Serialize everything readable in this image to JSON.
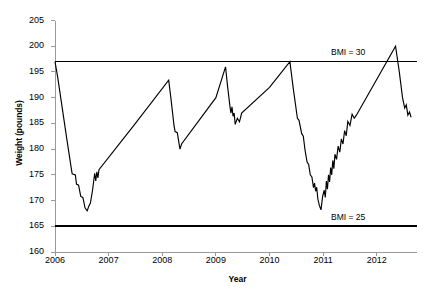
{
  "chart_data": {
    "type": "line",
    "title": "",
    "xlabel": "Year",
    "ylabel": "Weight (pounds)",
    "xlim": [
      2006,
      2012.75
    ],
    "ylim": [
      160,
      205
    ],
    "xticks": [
      "2006",
      "2007",
      "2008",
      "2009",
      "2010",
      "2011",
      "2012"
    ],
    "xtick_values": [
      2006,
      2007,
      2008,
      2009,
      2010,
      2011,
      2012
    ],
    "yticks": [
      "160",
      "165",
      "170",
      "175",
      "180",
      "185",
      "190",
      "195",
      "200",
      "205"
    ],
    "ytick_values": [
      160,
      165,
      170,
      175,
      180,
      185,
      190,
      195,
      200,
      205
    ],
    "grid": false,
    "legend": false,
    "line_color": "#000000",
    "reference_lines": [
      {
        "label": "BMI = 30",
        "value": 197,
        "color": "#000000"
      },
      {
        "label": "BMI = 25",
        "value": 165,
        "color": "#000000"
      }
    ],
    "series": [
      {
        "name": "Weight",
        "points": [
          [
            2006.0,
            197.0
          ],
          [
            2006.05,
            194.0
          ],
          [
            2006.22,
            182.0
          ],
          [
            2006.3,
            176.5
          ],
          [
            2006.32,
            175.2
          ],
          [
            2006.38,
            175.0
          ],
          [
            2006.4,
            173.2
          ],
          [
            2006.44,
            173.0
          ],
          [
            2006.48,
            170.8
          ],
          [
            2006.52,
            170.6
          ],
          [
            2006.56,
            168.6
          ],
          [
            2006.6,
            168.0
          ],
          [
            2006.63,
            168.9
          ],
          [
            2006.66,
            169.5
          ],
          [
            2006.7,
            172.0
          ],
          [
            2006.74,
            175.3
          ],
          [
            2006.76,
            173.8
          ],
          [
            2006.78,
            175.6
          ],
          [
            2006.8,
            174.4
          ],
          [
            2006.82,
            176.0
          ],
          [
            2007.5,
            185.0
          ],
          [
            2008.12,
            193.4
          ],
          [
            2008.16,
            190.0
          ],
          [
            2008.22,
            184.5
          ],
          [
            2008.24,
            183.4
          ],
          [
            2008.28,
            183.2
          ],
          [
            2008.33,
            180.0
          ],
          [
            2008.36,
            181.0
          ],
          [
            2009.0,
            190.0
          ],
          [
            2009.18,
            196.0
          ],
          [
            2009.22,
            192.0
          ],
          [
            2009.26,
            188.5
          ],
          [
            2009.28,
            187.0
          ],
          [
            2009.3,
            188.2
          ],
          [
            2009.32,
            186.4
          ],
          [
            2009.34,
            187.0
          ],
          [
            2009.36,
            184.8
          ],
          [
            2009.4,
            186.0
          ],
          [
            2009.44,
            185.3
          ],
          [
            2009.48,
            187.0
          ],
          [
            2010.0,
            192.0
          ],
          [
            2010.38,
            197.0
          ],
          [
            2010.44,
            192.0
          ],
          [
            2010.52,
            186.0
          ],
          [
            2010.55,
            185.6
          ],
          [
            2010.6,
            183.0
          ],
          [
            2010.63,
            182.5
          ],
          [
            2010.66,
            180.0
          ],
          [
            2010.7,
            177.5
          ],
          [
            2010.73,
            177.0
          ],
          [
            2010.76,
            175.0
          ],
          [
            2010.79,
            174.6
          ],
          [
            2010.82,
            172.5
          ],
          [
            2010.84,
            173.4
          ],
          [
            2010.86,
            171.8
          ],
          [
            2010.88,
            172.6
          ],
          [
            2010.9,
            170.4
          ],
          [
            2010.93,
            169.0
          ],
          [
            2010.96,
            168.2
          ],
          [
            2010.99,
            170.8
          ],
          [
            2011.02,
            172.0
          ],
          [
            2011.04,
            170.6
          ],
          [
            2011.06,
            173.8
          ],
          [
            2011.08,
            172.2
          ],
          [
            2011.1,
            175.0
          ],
          [
            2011.12,
            173.6
          ],
          [
            2011.14,
            176.4
          ],
          [
            2011.16,
            175.0
          ],
          [
            2011.18,
            177.8
          ],
          [
            2011.2,
            176.2
          ],
          [
            2011.22,
            179.0
          ],
          [
            2011.25,
            178.0
          ],
          [
            2011.28,
            180.6
          ],
          [
            2011.31,
            179.4
          ],
          [
            2011.34,
            182.0
          ],
          [
            2011.37,
            181.0
          ],
          [
            2011.4,
            183.6
          ],
          [
            2011.43,
            182.6
          ],
          [
            2011.46,
            185.4
          ],
          [
            2011.5,
            184.6
          ],
          [
            2011.54,
            186.8
          ],
          [
            2011.58,
            186.0
          ],
          [
            2011.62,
            186.6
          ],
          [
            2012.35,
            200.0
          ],
          [
            2012.42,
            195.0
          ],
          [
            2012.48,
            190.0
          ],
          [
            2012.52,
            188.0
          ],
          [
            2012.55,
            188.6
          ],
          [
            2012.58,
            186.6
          ],
          [
            2012.61,
            187.2
          ],
          [
            2012.64,
            186.2
          ]
        ]
      }
    ]
  }
}
